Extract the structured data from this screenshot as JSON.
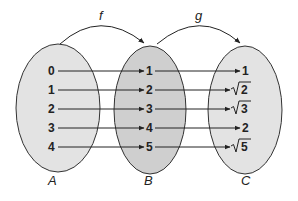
{
  "diagram": {
    "type": "function-composition-mapping",
    "colors": {
      "set_a_fill": "#e3e3e3",
      "set_b_fill": "#cfcfcf",
      "set_c_fill": "#e3e3e3",
      "stroke": "#333333"
    },
    "functions": [
      {
        "name": "f",
        "from": "A",
        "to": "B"
      },
      {
        "name": "g",
        "from": "B",
        "to": "C"
      }
    ],
    "sets": [
      {
        "label": "A",
        "elements": [
          "0",
          "1",
          "2",
          "3",
          "4"
        ]
      },
      {
        "label": "B",
        "elements": [
          "1",
          "2",
          "3",
          "4",
          "5"
        ]
      },
      {
        "label": "C",
        "elements": [
          "1",
          "√2",
          "√3",
          "2",
          "√5"
        ]
      }
    ],
    "c_display": [
      {
        "radical": false,
        "value": "1"
      },
      {
        "radical": true,
        "value": "2"
      },
      {
        "radical": true,
        "value": "3"
      },
      {
        "radical": false,
        "value": "2"
      },
      {
        "radical": true,
        "value": "5"
      }
    ],
    "mappings_f": [
      [
        "0",
        "1"
      ],
      [
        "1",
        "2"
      ],
      [
        "2",
        "3"
      ],
      [
        "3",
        "4"
      ],
      [
        "4",
        "5"
      ]
    ],
    "mappings_g": [
      [
        "1",
        "1"
      ],
      [
        "2",
        "√2"
      ],
      [
        "3",
        "√3"
      ],
      [
        "4",
        "2"
      ],
      [
        "5",
        "√5"
      ]
    ]
  }
}
